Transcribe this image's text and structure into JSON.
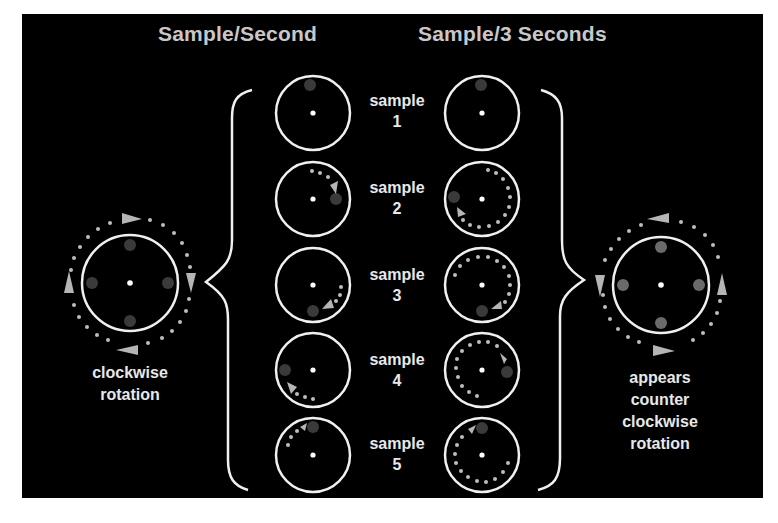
{
  "headers": {
    "left_column": "Sample/Second",
    "right_column": "Sample/3 Seconds"
  },
  "samples": [
    {
      "label": "sample",
      "number": "1"
    },
    {
      "label": "sample",
      "number": "2"
    },
    {
      "label": "sample",
      "number": "3"
    },
    {
      "label": "sample",
      "number": "4"
    },
    {
      "label": "sample",
      "number": "5"
    }
  ],
  "left_caption": {
    "line1": "clockwise",
    "line2": "rotation"
  },
  "right_caption": {
    "line1": "appears",
    "line2": "counter",
    "line3": "clockwise",
    "line4": "rotation"
  },
  "colors": {
    "background": "#000000",
    "page": "#ffffff",
    "circle_stroke": "#f0f0f0",
    "marker_dot": "#3a3a3a",
    "path_dot": "#bdbdbd",
    "arrow": "#b5b5b5",
    "title_text": "#c8c8c8"
  }
}
